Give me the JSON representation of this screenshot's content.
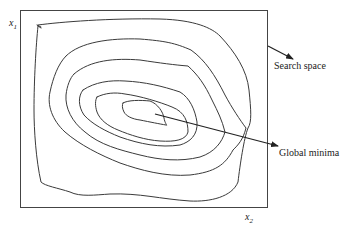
{
  "diagram": {
    "type": "contour-plot",
    "title": "",
    "axes": {
      "x1": {
        "base": "x",
        "sub": "1"
      },
      "x2": {
        "base": "x",
        "sub": "2"
      }
    },
    "annotations": {
      "search_space": "Search space",
      "global_minima": "Global minima"
    },
    "contour_count": 6,
    "colors": {
      "line": "#3a3a3a",
      "background": "#ffffff"
    }
  }
}
